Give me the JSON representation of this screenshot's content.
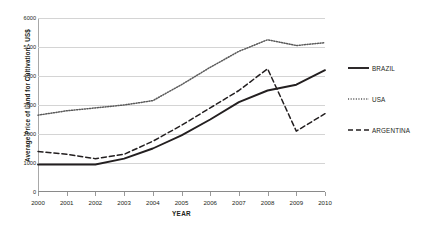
{
  "chart_data": {
    "type": "line",
    "title": "",
    "xlabel": "YEAR",
    "ylabel": "Average Price of Land for Cultivation - US$",
    "x": [
      2000,
      2001,
      2002,
      2003,
      2004,
      2005,
      2006,
      2007,
      2008,
      2009,
      2010
    ],
    "categories": [
      "2000",
      "2001",
      "2002",
      "2003",
      "2004",
      "2005",
      "2006",
      "2007",
      "2008",
      "2009",
      "2010"
    ],
    "xlim": [
      2000,
      2010
    ],
    "ylim": [
      0,
      6000
    ],
    "yticks": [
      0,
      1000,
      2000,
      3000,
      4000,
      5000,
      6000
    ],
    "ytick_labels": [
      "0",
      "1000",
      "2000",
      "3000",
      "4000",
      "5000",
      "6000"
    ],
    "grid": true,
    "legend_position": "right",
    "series": [
      {
        "name": "BRAZIL",
        "style": "solid",
        "color": "#231f20",
        "values": [
          950,
          950,
          950,
          1150,
          1500,
          1950,
          2500,
          3100,
          3500,
          3700,
          4200
        ]
      },
      {
        "name": "USA",
        "style": "dotted",
        "color": "#5a5a5a",
        "values": [
          2650,
          2800,
          2900,
          3000,
          3150,
          3700,
          4300,
          4850,
          5250,
          5050,
          5150
        ]
      },
      {
        "name": "ARGENTINA",
        "style": "dashed",
        "color": "#231f20",
        "values": [
          1400,
          1300,
          1150,
          1300,
          1750,
          2300,
          2900,
          3500,
          4250,
          2100,
          2700
        ]
      }
    ]
  },
  "legend": {
    "items": [
      {
        "label": "BRAZIL",
        "style": "solid"
      },
      {
        "label": "USA",
        "style": "dotted"
      },
      {
        "label": "ARGENTINA",
        "style": "dashed"
      }
    ]
  }
}
